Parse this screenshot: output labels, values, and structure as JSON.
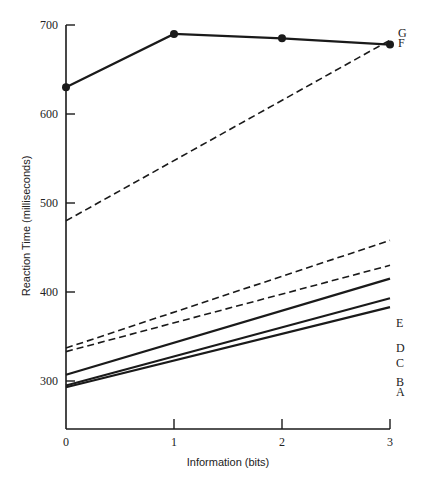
{
  "chart_data": {
    "type": "line",
    "title": "",
    "xlabel": "Information (bits)",
    "ylabel": "Reaction Time (milliseconds)",
    "x": [
      0,
      1,
      2,
      3
    ],
    "xticks": [
      "0",
      "1",
      "2",
      "3"
    ],
    "yticks": [
      "300",
      "400",
      "500",
      "600",
      "700"
    ],
    "ylim": [
      250,
      700
    ],
    "xlim": [
      0,
      3
    ],
    "grid": false,
    "legend": "inline labels at right end of lines",
    "series": [
      {
        "name": "A",
        "style": "solid",
        "x": [
          0,
          3
        ],
        "values": [
          293,
          383
        ]
      },
      {
        "name": "B",
        "style": "solid",
        "x": [
          0,
          3
        ],
        "values": [
          295,
          393
        ]
      },
      {
        "name": "C",
        "style": "solid",
        "x": [
          0,
          3
        ],
        "values": [
          307,
          415
        ]
      },
      {
        "name": "D",
        "style": "dashed",
        "x": [
          0,
          3
        ],
        "values": [
          333,
          430
        ]
      },
      {
        "name": "E",
        "style": "dashed",
        "x": [
          0,
          3
        ],
        "values": [
          337,
          458
        ]
      },
      {
        "name": "F",
        "style": "dashed",
        "x": [
          0,
          3
        ],
        "values": [
          480,
          683
        ]
      },
      {
        "name": "G",
        "style": "solid-markers",
        "x": [
          0,
          1,
          2,
          3
        ],
        "values": [
          630,
          690,
          685,
          678
        ]
      }
    ]
  }
}
